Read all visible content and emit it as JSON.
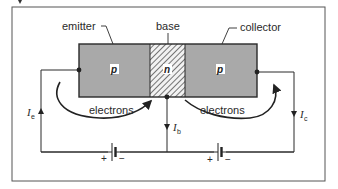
{
  "diagram": {
    "labels": {
      "emitter": "emitter",
      "base": "base",
      "collector": "collector"
    },
    "regions": [
      {
        "name": "emitter",
        "type": "p",
        "fill": "#a9a9a9"
      },
      {
        "name": "base",
        "type": "n",
        "fill": "hatched"
      },
      {
        "name": "collector",
        "type": "p",
        "fill": "#a9a9a9"
      }
    ],
    "flows": [
      {
        "label": "electrons",
        "side": "left"
      },
      {
        "label": "electrons",
        "side": "right"
      }
    ],
    "currents": {
      "emitter": {
        "symbol": "I",
        "sub": "e",
        "direction": "up"
      },
      "base": {
        "symbol": "I",
        "sub": "b",
        "direction": "down"
      },
      "collector": {
        "symbol": "I",
        "sub": "c",
        "direction": "down"
      }
    },
    "batteries": [
      {
        "plus": "+",
        "minus": "−"
      },
      {
        "plus": "+",
        "minus": "−"
      }
    ],
    "colors": {
      "semiconductor": "#a9a9a9",
      "line": "#2a2a2a",
      "frame": "#555555"
    }
  }
}
